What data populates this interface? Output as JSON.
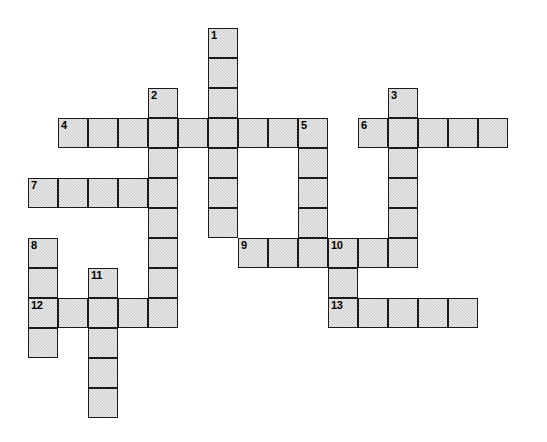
{
  "puzzle": {
    "title": "Crossword Puzzle Grid",
    "grid": {
      "cell_size": 30,
      "origin_x": 28,
      "origin_y": 28,
      "fill_color": "#c9c9c9",
      "border_color": "#1a1a1a",
      "background_color": "#ffffff"
    },
    "entries": [
      {
        "number": "1",
        "direction": "down",
        "col": 6,
        "row": 0,
        "length": 7
      },
      {
        "number": "2",
        "direction": "down",
        "col": 4,
        "row": 2,
        "length": 8
      },
      {
        "number": "3",
        "direction": "down",
        "col": 12,
        "row": 2,
        "length": 6
      },
      {
        "number": "4",
        "direction": "across",
        "col": 1,
        "row": 3,
        "length": 9
      },
      {
        "number": "5",
        "direction": "down",
        "col": 9,
        "row": 3,
        "length": 5
      },
      {
        "number": "6",
        "direction": "across",
        "col": 11,
        "row": 3,
        "length": 5
      },
      {
        "number": "7",
        "direction": "across",
        "col": 0,
        "row": 5,
        "length": 5
      },
      {
        "number": "8",
        "direction": "down",
        "col": 0,
        "row": 7,
        "length": 4
      },
      {
        "number": "9",
        "direction": "across",
        "col": 7,
        "row": 7,
        "length": 6
      },
      {
        "number": "10",
        "direction": "down",
        "col": 10,
        "row": 7,
        "length": 3
      },
      {
        "number": "11",
        "direction": "down",
        "col": 2,
        "row": 8,
        "length": 5
      },
      {
        "number": "12",
        "direction": "across",
        "col": 0,
        "row": 9,
        "length": 5
      },
      {
        "number": "13",
        "direction": "across",
        "col": 10,
        "row": 9,
        "length": 5
      }
    ],
    "numbered_cells": [
      {
        "label": "1",
        "col": 6,
        "row": 0
      },
      {
        "label": "2",
        "col": 4,
        "row": 2
      },
      {
        "label": "3",
        "col": 12,
        "row": 2
      },
      {
        "label": "4",
        "col": 1,
        "row": 3
      },
      {
        "label": "5",
        "col": 9,
        "row": 3
      },
      {
        "label": "6",
        "col": 11,
        "row": 3
      },
      {
        "label": "7",
        "col": 0,
        "row": 5
      },
      {
        "label": "8",
        "col": 0,
        "row": 7
      },
      {
        "label": "9",
        "col": 7,
        "row": 7
      },
      {
        "label": "10",
        "col": 10,
        "row": 7
      },
      {
        "label": "11",
        "col": 2,
        "row": 8
      },
      {
        "label": "12",
        "col": 0,
        "row": 9
      },
      {
        "label": "13",
        "col": 10,
        "row": 9
      }
    ]
  }
}
